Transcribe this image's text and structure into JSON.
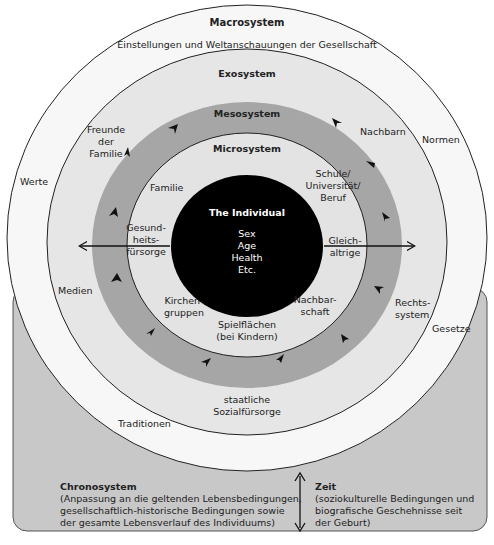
{
  "colors": {
    "chrono_box": "#c8c8c8",
    "macro_ring": "#f7f7f7",
    "exo_ring": "#e6e6e6",
    "meso_ring": "#a6a6a6",
    "micro_ring": "#e3e3e3",
    "individual": "#000000",
    "stroke": "#222222"
  },
  "macrosystem": {
    "title": "Macrosystem",
    "subtitle": "Einstellungen und Weltanschauungen der Gesellschaft",
    "items": [
      "Werte",
      "Normen",
      "Gesetze",
      "Traditionen"
    ]
  },
  "exosystem": {
    "title": "Exosystem",
    "items": [
      "Freunde der Familie",
      "Nachbarn",
      "Medien",
      "Rechts-system",
      "staatliche Sozialfürsorge"
    ],
    "freunde_lines": [
      "Freunde",
      "der",
      "Familie"
    ],
    "rechts_lines": [
      "Rechts-",
      "system"
    ],
    "sozial_lines": [
      "staatliche",
      "Sozialfürsorge"
    ]
  },
  "mesosystem": {
    "title": "Mesosystem"
  },
  "microsystem": {
    "title": "Microsystem",
    "familie": "Familie",
    "schule_lines": [
      "Schule/",
      "Universität/",
      "Beruf"
    ],
    "gesund_lines": [
      "Gesund-",
      "heits-",
      "fürsorge"
    ],
    "gleich_lines": [
      "Gleich-",
      "altrige"
    ],
    "kirchen_lines": [
      "Kirchen-",
      "gruppen"
    ],
    "nachbarschaft_lines": [
      "Nachbar-",
      "schaft"
    ],
    "spiel_lines": [
      "Spielflächen",
      "(bei Kindern)"
    ]
  },
  "individual": {
    "title": "The Individual",
    "attributes": [
      "Sex",
      "Age",
      "Health",
      "Etc."
    ]
  },
  "chronosystem": {
    "title": "Chronosystem",
    "description_lines": [
      "(Anpassung an die geltenden Lebensbedingungen,",
      "gesellschaftlich-historische Bedingungen sowie",
      "der gesamte Lebensverlauf des Individuums)"
    ]
  },
  "zeit": {
    "title": "Zeit",
    "description_lines": [
      "(soziokulturelle Bedingungen und",
      "biografische Geschehnisse seit",
      "der Geburt)"
    ]
  }
}
